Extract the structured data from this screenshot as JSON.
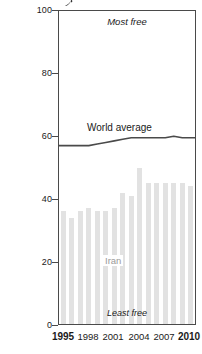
{
  "chart_data": {
    "type": "bar",
    "title": "",
    "subtitle": "",
    "xlabel": "",
    "ylabel": "",
    "ylim": [
      0,
      100
    ],
    "ytick_labels": [
      "100",
      "80",
      "60",
      "40",
      "20",
      "0"
    ],
    "ytick_values": [
      100,
      80,
      60,
      40,
      20,
      0
    ],
    "xtick_labels": [
      "1995",
      "1998",
      "2001",
      "2004",
      "2007",
      "2010"
    ],
    "xtick_values": [
      1995,
      1998,
      2001,
      2004,
      2007,
      2010
    ],
    "grid": false,
    "legend": "none",
    "categories": [
      "1995",
      "1996",
      "1997",
      "1998",
      "1999",
      "2000",
      "2001",
      "2002",
      "2003",
      "2004",
      "2005",
      "2006",
      "2007",
      "2008",
      "2009",
      "2010"
    ],
    "series": [
      {
        "name": "Iran",
        "type": "bar",
        "color": "#e2e2e2",
        "values": [
          36,
          34,
          36,
          37,
          36,
          36,
          37,
          42,
          41,
          50,
          45,
          45,
          45,
          45,
          45,
          44
        ]
      },
      {
        "name": "World average",
        "type": "line",
        "color": "#4a4a4a",
        "values": [
          57,
          57,
          57,
          57,
          57.5,
          58,
          58.5,
          59,
          59.5,
          59.5,
          59.5,
          59.5,
          59.5,
          60,
          59.5,
          59.5
        ]
      }
    ],
    "annotations": [
      {
        "id": "most-free",
        "text": "Most free",
        "position": "top-center"
      },
      {
        "id": "least-free",
        "text": "Least free",
        "position": "bottom-center"
      },
      {
        "id": "series-label-line",
        "text": "World average",
        "position": "above-line"
      },
      {
        "id": "series-label-bars",
        "text": "Iran",
        "position": "within-bars"
      }
    ]
  }
}
